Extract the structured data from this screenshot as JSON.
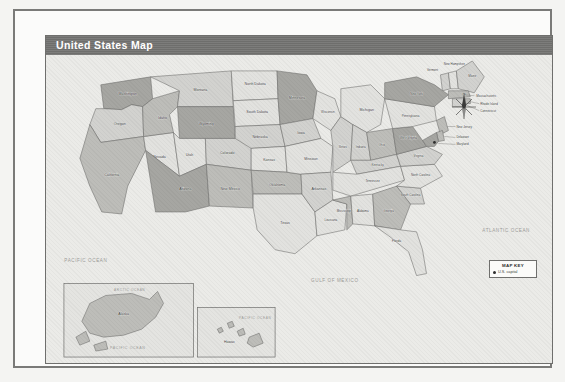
{
  "document": {
    "title": "United States Map"
  },
  "map": {
    "title": "United States Map",
    "oceans": [
      {
        "name": "pacific-ocean",
        "label": "PACIFIC OCEAN"
      },
      {
        "name": "atlantic-ocean",
        "label": "ATLANTIC OCEAN"
      },
      {
        "name": "gulf-of-mexico",
        "label": "GULF OF MEXICO"
      },
      {
        "name": "pacific-ocean-alaska",
        "label": "PACIFIC OCEAN"
      },
      {
        "name": "pacific-ocean-hawaii",
        "label": "PACIFIC OCEAN"
      },
      {
        "name": "arctic-ocean",
        "label": "ARCTIC OCEAN"
      }
    ],
    "compass": {
      "north": "N"
    },
    "legend": {
      "title": "MAP KEY",
      "items": [
        {
          "symbol": "dot",
          "label": "U.S. capital"
        }
      ]
    },
    "insets": [
      {
        "name": "alaska-inset",
        "label": "Alaska"
      },
      {
        "name": "hawaii-inset",
        "label": "Hawaii"
      }
    ],
    "states": [
      {
        "id": "WA",
        "label": "Washington",
        "tone": 4
      },
      {
        "id": "OR",
        "label": "Oregon",
        "tone": 2
      },
      {
        "id": "CA",
        "label": "California",
        "tone": 3
      },
      {
        "id": "NV",
        "label": "Nevada",
        "tone": 1
      },
      {
        "id": "ID",
        "label": "Idaho",
        "tone": 3
      },
      {
        "id": "MT",
        "label": "Montana",
        "tone": 2
      },
      {
        "id": "WY",
        "label": "Wyoming",
        "tone": 4
      },
      {
        "id": "UT",
        "label": "Utah",
        "tone": 1
      },
      {
        "id": "AZ",
        "label": "Arizona",
        "tone": 4
      },
      {
        "id": "CO",
        "label": "Colorado",
        "tone": 2
      },
      {
        "id": "NM",
        "label": "New Mexico",
        "tone": 3
      },
      {
        "id": "ND",
        "label": "North Dakota",
        "tone": 1
      },
      {
        "id": "SD",
        "label": "South Dakota",
        "tone": 1
      },
      {
        "id": "NE",
        "label": "Nebraska",
        "tone": 2
      },
      {
        "id": "KS",
        "label": "Kansas",
        "tone": 1
      },
      {
        "id": "OK",
        "label": "Oklahoma",
        "tone": 3
      },
      {
        "id": "TX",
        "label": "Texas",
        "tone": 1
      },
      {
        "id": "MN",
        "label": "Minnesota",
        "tone": 4
      },
      {
        "id": "IA",
        "label": "Iowa",
        "tone": 2
      },
      {
        "id": "MO",
        "label": "Missouri",
        "tone": 1
      },
      {
        "id": "AR",
        "label": "Arkansas",
        "tone": 2
      },
      {
        "id": "LA",
        "label": "Louisiana",
        "tone": 1
      },
      {
        "id": "WI",
        "label": "Wisconsin",
        "tone": 1
      },
      {
        "id": "IL",
        "label": "Illinois",
        "tone": 2
      },
      {
        "id": "MS",
        "label": "Mississippi",
        "tone": 3
      },
      {
        "id": "MI",
        "label": "Michigan",
        "tone": 1
      },
      {
        "id": "IN",
        "label": "Indiana",
        "tone": 2
      },
      {
        "id": "OH",
        "label": "Ohio",
        "tone": 3
      },
      {
        "id": "KY",
        "label": "Kentucky",
        "tone": 2
      },
      {
        "id": "TN",
        "label": "Tennessee",
        "tone": 1
      },
      {
        "id": "AL",
        "label": "Alabama",
        "tone": 1
      },
      {
        "id": "GA",
        "label": "Georgia",
        "tone": 3
      },
      {
        "id": "FL",
        "label": "Florida",
        "tone": 1
      },
      {
        "id": "SC",
        "label": "South Carolina",
        "tone": 2
      },
      {
        "id": "NC",
        "label": "North Carolina",
        "tone": 1
      },
      {
        "id": "VA",
        "label": "Virginia",
        "tone": 2
      },
      {
        "id": "WV",
        "label": "West Virginia",
        "tone": 4
      },
      {
        "id": "PA",
        "label": "Pennsylvania",
        "tone": 1
      },
      {
        "id": "NY",
        "label": "New York",
        "tone": 4
      },
      {
        "id": "VT",
        "label": "Vermont",
        "tone": 2
      },
      {
        "id": "NH",
        "label": "New Hampshire",
        "tone": 1
      },
      {
        "id": "ME",
        "label": "Maine",
        "tone": 2
      },
      {
        "id": "MA",
        "label": "Massachusetts",
        "tone": 3
      },
      {
        "id": "RI",
        "label": "Rhode Island",
        "tone": 3
      },
      {
        "id": "CT",
        "label": "Connecticut",
        "tone": 2
      },
      {
        "id": "NJ",
        "label": "New Jersey",
        "tone": 3
      },
      {
        "id": "DE",
        "label": "Delaware",
        "tone": 3
      },
      {
        "id": "MD",
        "label": "Maryland",
        "tone": 4
      },
      {
        "id": "AK",
        "label": "Alaska",
        "tone": 3
      },
      {
        "id": "HI",
        "label": "Hawaii",
        "tone": 3
      }
    ]
  }
}
